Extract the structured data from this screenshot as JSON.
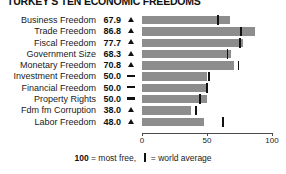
{
  "chart_data": {
    "type": "bar",
    "title": "TURKEY'S TEN ECONOMIC FREEDOMS",
    "xlabel": "",
    "ylabel": "",
    "xlim": [
      0,
      100
    ],
    "grid": false,
    "legend": "none",
    "orientation": "horizontal",
    "axis_ticks": [
      0,
      50,
      100
    ],
    "axis_tick_labels": [
      "0",
      "50",
      "100"
    ],
    "world_average_note": "world average",
    "categories": [
      "Business Freedom",
      "Trade Freedom",
      "Fiscal Freedom",
      "Government Size",
      "Monetary Freedom",
      "Investment Freedom",
      "Financial Freedom",
      "Property Rights",
      "Fdm fm Corruption",
      "Labor Freedom"
    ],
    "values": [
      67.9,
      86.8,
      77.7,
      68.3,
      70.8,
      50.0,
      50.0,
      50.0,
      38.0,
      48.0
    ],
    "value_labels": [
      "67.9",
      "86.8",
      "77.7",
      "68.3",
      "70.8",
      "50.0",
      "50.0",
      "50.0",
      "38.0",
      "48.0"
    ],
    "trends": [
      "up",
      "up",
      "up",
      "up",
      "up",
      "flat",
      "flat",
      "flat",
      "up",
      "up"
    ],
    "world_averages": [
      57.5,
      75.2,
      74.9,
      65.0,
      73.5,
      50.5,
      49.0,
      44.0,
      40.5,
      61.5
    ],
    "bar_color": "#8d8d8d",
    "marker_color": "#111111",
    "text_color": "#1a1a1a"
  },
  "footnote": {
    "most_free_value": "100",
    "most_free_text": "= most free,",
    "average_text": "= world average"
  }
}
